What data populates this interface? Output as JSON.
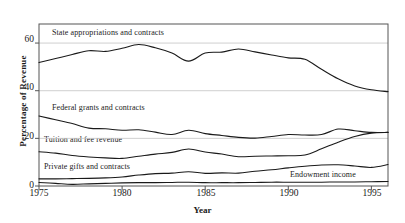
{
  "chart_data": {
    "type": "line",
    "title": "",
    "xlabel": "Year",
    "ylabel": "Percentage of Revenue",
    "xlim": [
      1975,
      1996
    ],
    "ylim": [
      0,
      68
    ],
    "grid": true,
    "grid_axis": "y",
    "legend_position": "inline-labels",
    "xticks": [
      1975,
      1980,
      1985,
      1990,
      1995
    ],
    "yticks": [
      0,
      20,
      40,
      60
    ],
    "x": [
      1975,
      1976,
      1977,
      1978,
      1979,
      1980,
      1981,
      1982,
      1983,
      1984,
      1985,
      1986,
      1987,
      1988,
      1989,
      1990,
      1991,
      1992,
      1993,
      1994,
      1995,
      1996
    ],
    "series": [
      {
        "name": "State appropriations and contracts",
        "values": [
          51.8,
          53.5,
          55.2,
          56.8,
          56.5,
          57.8,
          59.4,
          58.0,
          55.8,
          52.4,
          55.8,
          56.2,
          57.5,
          56.3,
          55.0,
          53.8,
          53.2,
          49.0,
          45.0,
          42.0,
          40.4,
          39.6
        ]
      },
      {
        "name": "Federal grants and contracts",
        "values": [
          29.4,
          27.8,
          26.2,
          24.3,
          24.0,
          23.4,
          23.6,
          22.6,
          21.6,
          23.4,
          22.0,
          21.2,
          20.4,
          20.1,
          20.8,
          21.6,
          21.4,
          21.6,
          23.9,
          23.2,
          22.5,
          22.5
        ]
      },
      {
        "name": "Tuition and fee revenue",
        "values": [
          14.4,
          13.8,
          12.8,
          12.2,
          11.8,
          11.6,
          12.5,
          13.4,
          14.1,
          15.5,
          14.3,
          13.4,
          12.3,
          12.5,
          12.6,
          12.7,
          13.0,
          15.6,
          18.4,
          20.8,
          22.2,
          22.5
        ]
      },
      {
        "name": "Private gifts and contracts",
        "values": [
          3.0,
          3.0,
          3.1,
          3.2,
          3.4,
          3.8,
          4.6,
          5.2,
          5.4,
          6.0,
          5.3,
          5.5,
          5.4,
          6.2,
          6.8,
          7.6,
          8.3,
          8.8,
          8.9,
          8.4,
          7.8,
          9.0
        ]
      },
      {
        "name": "Endowment income",
        "values": [
          1.5,
          1.1,
          0.7,
          0.9,
          1.1,
          1.3,
          1.4,
          1.4,
          1.5,
          1.6,
          1.4,
          1.4,
          1.4,
          1.5,
          1.6,
          1.6,
          1.6,
          1.6,
          1.7,
          1.7,
          1.8,
          1.9
        ]
      }
    ],
    "series_label_positions": [
      {
        "label_for": "State appropriations and contracts",
        "left": 52,
        "top": 28
      },
      {
        "label_for": "Federal grants and contracts",
        "left": 52,
        "top": 103
      },
      {
        "label_for": "Tuition and fee revenue",
        "left": 44,
        "top": 135
      },
      {
        "label_for": "Private gifts and contracts",
        "left": 44,
        "top": 162
      },
      {
        "label_for": "Endowment income",
        "left": 290,
        "top": 170
      }
    ],
    "colors": {
      "line": "#1a1a1a",
      "grid": "#c9c9c9",
      "frame": "#555555"
    }
  }
}
